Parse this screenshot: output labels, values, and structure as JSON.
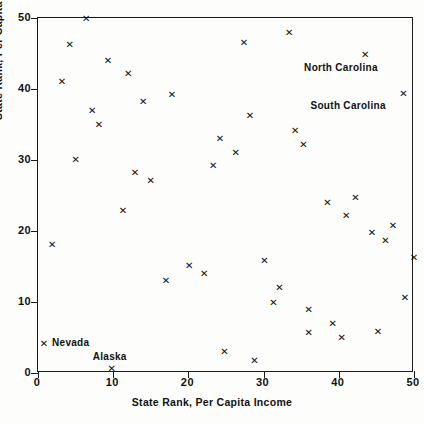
{
  "chart_data": {
    "type": "scatter",
    "title": "",
    "xlabel": "State Rank, Per Capita Income",
    "ylabel": "State Rank, Per Capita Grants",
    "xlim": [
      0,
      50
    ],
    "ylim": [
      0,
      50
    ],
    "xticks": [
      0,
      10,
      20,
      30,
      40,
      50
    ],
    "yticks": [
      0,
      10,
      20,
      30,
      40,
      50
    ],
    "xtick_labels": [
      "0",
      "10",
      "20",
      "30",
      "40",
      "50"
    ],
    "ytick_labels": [
      "0",
      "10",
      "20",
      "30",
      "40",
      "50"
    ],
    "grid": false,
    "legend": false,
    "marker": "x",
    "points": [
      {
        "x": 6.4,
        "y": 50.0
      },
      {
        "x": 33.4,
        "y": 48.0
      },
      {
        "x": 4.2,
        "y": 46.2
      },
      {
        "x": 27.4,
        "y": 46.5
      },
      {
        "x": 43.5,
        "y": 44.8,
        "label": "North Carolina"
      },
      {
        "x": 9.3,
        "y": 44.0
      },
      {
        "x": 12.0,
        "y": 42.2
      },
      {
        "x": 3.2,
        "y": 41.0
      },
      {
        "x": 48.6,
        "y": 39.4,
        "label": "South Carolina"
      },
      {
        "x": 14.0,
        "y": 38.2
      },
      {
        "x": 17.8,
        "y": 39.2
      },
      {
        "x": 7.2,
        "y": 37.0
      },
      {
        "x": 28.2,
        "y": 36.3
      },
      {
        "x": 8.1,
        "y": 35.0
      },
      {
        "x": 34.2,
        "y": 34.2
      },
      {
        "x": 35.3,
        "y": 32.2
      },
      {
        "x": 24.2,
        "y": 33.0
      },
      {
        "x": 26.3,
        "y": 31.0
      },
      {
        "x": 5.0,
        "y": 30.1
      },
      {
        "x": 23.3,
        "y": 29.2
      },
      {
        "x": 12.9,
        "y": 28.2
      },
      {
        "x": 15.0,
        "y": 27.1
      },
      {
        "x": 38.5,
        "y": 24.0
      },
      {
        "x": 42.2,
        "y": 24.7
      },
      {
        "x": 41.0,
        "y": 22.2
      },
      {
        "x": 11.3,
        "y": 22.9
      },
      {
        "x": 47.2,
        "y": 20.8
      },
      {
        "x": 44.4,
        "y": 19.8
      },
      {
        "x": 46.2,
        "y": 18.7
      },
      {
        "x": 1.9,
        "y": 18.1
      },
      {
        "x": 30.1,
        "y": 15.9
      },
      {
        "x": 20.1,
        "y": 15.2
      },
      {
        "x": 22.1,
        "y": 14.0
      },
      {
        "x": 50.0,
        "y": 16.2
      },
      {
        "x": 17.0,
        "y": 13.0
      },
      {
        "x": 32.1,
        "y": 12.0
      },
      {
        "x": 31.3,
        "y": 10.0
      },
      {
        "x": 48.8,
        "y": 10.7
      },
      {
        "x": 36.0,
        "y": 9.0
      },
      {
        "x": 39.2,
        "y": 7.0
      },
      {
        "x": 40.4,
        "y": 5.0
      },
      {
        "x": 36.0,
        "y": 5.7
      },
      {
        "x": 45.2,
        "y": 5.8
      },
      {
        "x": 0.8,
        "y": 4.1,
        "label": "Nevada"
      },
      {
        "x": 24.8,
        "y": 3.0
      },
      {
        "x": 28.8,
        "y": 1.8
      },
      {
        "x": 9.8,
        "y": 0.7,
        "label": "Alaska"
      }
    ],
    "annotations": [
      {
        "text": "North Carolina",
        "x": 43.5,
        "y": 44.8
      },
      {
        "text": "South Carolina",
        "x": 48.6,
        "y": 39.4
      },
      {
        "text": "Nevada",
        "x": 0.8,
        "y": 4.1
      },
      {
        "text": "Alaska",
        "x": 9.8,
        "y": 0.7
      }
    ]
  }
}
